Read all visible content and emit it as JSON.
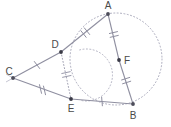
{
  "figure": {
    "width": 171,
    "height": 127,
    "background": "#ffffff",
    "stroke_color": "#8a8a9a",
    "label_color": "#4a4a4a",
    "point_color": "#3a3a3a"
  },
  "points": [
    {
      "name": "A",
      "label": "A",
      "x": 108,
      "y": 14,
      "label_x": 108,
      "label_y": 9,
      "dot": true
    },
    {
      "name": "B",
      "label": "B",
      "x": 133,
      "y": 104,
      "label_x": 133,
      "label_y": 119,
      "dot": true
    },
    {
      "name": "C",
      "label": "C",
      "x": 13,
      "y": 78,
      "label_x": 9,
      "label_y": 75,
      "dot": true
    },
    {
      "name": "D",
      "label": "D",
      "x": 61,
      "y": 52,
      "label_x": 55,
      "label_y": 48,
      "dot": true
    },
    {
      "name": "E",
      "label": "E",
      "x": 71,
      "y": 99,
      "label_x": 71,
      "label_y": 112,
      "dot": true
    },
    {
      "name": "F",
      "label": "F",
      "x": 119,
      "y": 60,
      "label_x": 127,
      "label_y": 64,
      "dot": true
    }
  ],
  "segments": [
    {
      "name": "segment-C-D",
      "from": "C",
      "to": "D",
      "style": "solid",
      "ticks": 1,
      "x1": 13,
      "y1": 78,
      "x2": 61,
      "y2": 52
    },
    {
      "name": "segment-D-A",
      "from": "D",
      "to": "A",
      "style": "solid",
      "ticks": 2,
      "x1": 61,
      "y1": 52,
      "x2": 108,
      "y2": 14
    },
    {
      "name": "segment-C-E",
      "from": "C",
      "to": "E",
      "style": "solid",
      "ticks": 2,
      "x1": 13,
      "y1": 78,
      "x2": 71,
      "y2": 99
    },
    {
      "name": "segment-E-B",
      "from": "E",
      "to": "B",
      "style": "solid",
      "ticks": 1,
      "x1": 71,
      "y1": 99,
      "x2": 133,
      "y2": 104
    },
    {
      "name": "segment-A-F",
      "from": "A",
      "to": "F",
      "style": "solid",
      "ticks": 2,
      "x1": 108,
      "y1": 14,
      "x2": 119,
      "y2": 60
    },
    {
      "name": "segment-F-B",
      "from": "F",
      "to": "B",
      "style": "solid",
      "ticks": 2,
      "x1": 119,
      "y1": 60,
      "x2": 133,
      "y2": 104
    },
    {
      "name": "segment-D-E",
      "from": "D",
      "to": "E",
      "style": "dotted",
      "ticks": 2,
      "x1": 61,
      "y1": 52,
      "x2": 71,
      "y2": 99
    }
  ],
  "circles": [
    {
      "name": "circumcircle-A-B",
      "cx": 116,
      "cy": 59,
      "r": 46,
      "style": "dotted"
    },
    {
      "name": "arc-through-D-E",
      "cx": 73,
      "cy": 75,
      "r": 26,
      "style": "dotted",
      "start_deg": -75,
      "end_deg": 105
    }
  ]
}
